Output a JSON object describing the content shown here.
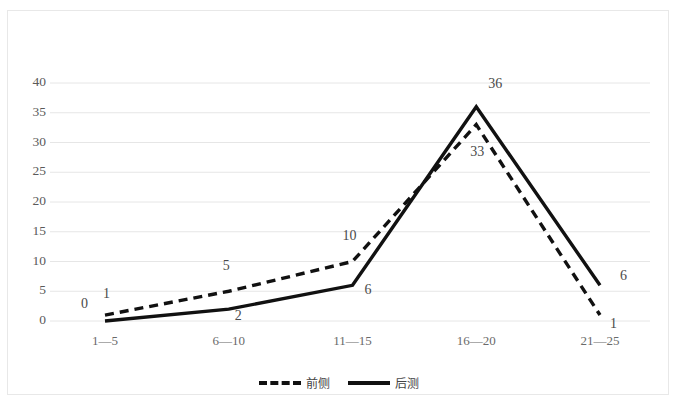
{
  "chart_data": {
    "type": "line",
    "title": "",
    "xlabel": "",
    "ylabel": "",
    "categories": [
      "1—5",
      "6—10",
      "11—15",
      "16—20",
      "21—25"
    ],
    "series": [
      {
        "name": "前侧",
        "style": "dashed",
        "color": "#111111",
        "values": [
          1,
          5,
          10,
          33,
          1
        ],
        "labels": [
          "1",
          "5",
          "10",
          "33",
          "1"
        ]
      },
      {
        "name": "后测",
        "style": "solid",
        "color": "#111111",
        "values": [
          0,
          2,
          6,
          36,
          6
        ],
        "labels": [
          "0",
          "2",
          "6",
          "36",
          "6"
        ]
      }
    ],
    "ylim": [
      0,
      40
    ],
    "yticks": [
      0,
      5,
      10,
      15,
      20,
      25,
      30,
      35,
      40
    ],
    "ytick_labels": [
      "0",
      "5",
      "10",
      "15",
      "20",
      "25",
      "30",
      "35",
      "40"
    ],
    "grid": true,
    "grid_color": "#e6e6e6",
    "legend_position": "bottom",
    "border_color": "#e8e8e8",
    "background": "#ffffff"
  }
}
